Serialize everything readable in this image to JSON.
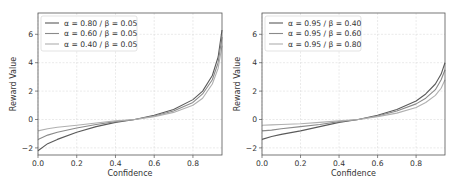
{
  "chart_data": [
    {
      "type": "line",
      "title": "",
      "xlabel": "Confidence",
      "ylabel": "Reward Value",
      "xlim": [
        0.0,
        0.95
      ],
      "ylim": [
        -2.5,
        7.5
      ],
      "xticks": [
        "0.0",
        "0.2",
        "0.4",
        "0.6",
        "0.8"
      ],
      "yticks": [
        "-2",
        "0",
        "2",
        "4",
        "6"
      ],
      "grid": true,
      "legend": "top-left",
      "series": [
        {
          "name": "α = 0.80 / β = 0.05",
          "color": "#5a5a5a",
          "x": [
            0.0,
            0.05,
            0.1,
            0.2,
            0.3,
            0.4,
            0.5,
            0.6,
            0.7,
            0.8,
            0.85,
            0.9,
            0.93,
            0.95
          ],
          "y": [
            -2.2,
            -1.7,
            -1.4,
            -0.9,
            -0.5,
            -0.2,
            0.0,
            0.3,
            0.7,
            1.4,
            2.0,
            3.1,
            4.4,
            6.3
          ]
        },
        {
          "name": "α = 0.60 / β = 0.05",
          "color": "#8a8a8a",
          "x": [
            0.0,
            0.05,
            0.1,
            0.2,
            0.3,
            0.4,
            0.5,
            0.6,
            0.7,
            0.8,
            0.85,
            0.9,
            0.93,
            0.95
          ],
          "y": [
            -1.4,
            -1.1,
            -0.9,
            -0.6,
            -0.35,
            -0.15,
            0.0,
            0.25,
            0.6,
            1.2,
            1.8,
            2.8,
            4.0,
            5.8
          ]
        },
        {
          "name": "α = 0.40 / β = 0.05",
          "color": "#b0b0b0",
          "x": [
            0.0,
            0.05,
            0.1,
            0.2,
            0.3,
            0.4,
            0.5,
            0.6,
            0.7,
            0.8,
            0.85,
            0.9,
            0.93,
            0.95
          ],
          "y": [
            -0.8,
            -0.65,
            -0.55,
            -0.4,
            -0.25,
            -0.1,
            0.0,
            0.2,
            0.5,
            1.0,
            1.5,
            2.5,
            3.6,
            5.2
          ]
        }
      ]
    },
    {
      "type": "line",
      "title": "",
      "xlabel": "Confidence",
      "ylabel": "Reward Value",
      "xlim": [
        0.0,
        0.95
      ],
      "ylim": [
        -2.5,
        7.5
      ],
      "xticks": [
        "0.0",
        "0.2",
        "0.4",
        "0.6",
        "0.8"
      ],
      "yticks": [
        "-2",
        "0",
        "2",
        "4",
        "6"
      ],
      "grid": true,
      "legend": "top-left",
      "series": [
        {
          "name": "α = 0.95 / β = 0.40",
          "color": "#5a5a5a",
          "x": [
            0.0,
            0.05,
            0.1,
            0.2,
            0.3,
            0.4,
            0.5,
            0.6,
            0.7,
            0.8,
            0.85,
            0.9,
            0.93,
            0.95
          ],
          "y": [
            -1.4,
            -1.2,
            -1.05,
            -0.8,
            -0.5,
            -0.2,
            0.0,
            0.3,
            0.7,
            1.3,
            1.8,
            2.5,
            3.2,
            4.0
          ]
        },
        {
          "name": "α = 0.95 / β = 0.60",
          "color": "#8a8a8a",
          "x": [
            0.0,
            0.05,
            0.1,
            0.2,
            0.3,
            0.4,
            0.5,
            0.6,
            0.7,
            0.8,
            0.85,
            0.9,
            0.93,
            0.95
          ],
          "y": [
            -0.8,
            -0.75,
            -0.65,
            -0.5,
            -0.35,
            -0.15,
            0.0,
            0.25,
            0.6,
            1.1,
            1.5,
            2.1,
            2.8,
            3.5
          ]
        },
        {
          "name": "α = 0.95 / β = 0.80",
          "color": "#b0b0b0",
          "x": [
            0.0,
            0.05,
            0.1,
            0.2,
            0.3,
            0.4,
            0.5,
            0.6,
            0.7,
            0.8,
            0.85,
            0.9,
            0.93,
            0.95
          ],
          "y": [
            -0.4,
            -0.38,
            -0.35,
            -0.3,
            -0.2,
            -0.1,
            0.0,
            0.2,
            0.45,
            0.85,
            1.2,
            1.7,
            2.2,
            2.8
          ]
        }
      ]
    }
  ]
}
